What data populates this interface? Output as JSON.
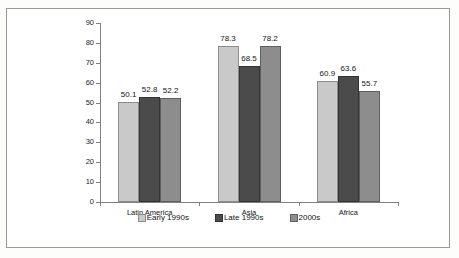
{
  "chart_data": {
    "type": "bar",
    "title": "",
    "xlabel": "",
    "ylabel": "Informal employment (in %)",
    "categories": [
      "Latin America",
      "Asia",
      "Africa"
    ],
    "series": [
      {
        "name": "Early 1990s",
        "color": "#c9c9c9",
        "values": [
          50.1,
          78.3,
          60.9
        ]
      },
      {
        "name": "Late 1990s",
        "color": "#4b4b4b",
        "values": [
          52.8,
          68.5,
          63.6
        ]
      },
      {
        "name": "2000s",
        "color": "#8d8d8d",
        "values": [
          52.2,
          78.2,
          55.7
        ]
      }
    ],
    "ylim": [
      0,
      90
    ],
    "ytick_step": 10,
    "yticks": [
      0,
      10,
      20,
      30,
      40,
      50,
      60,
      70,
      80,
      90
    ],
    "ytick_labels": [
      "0",
      "10",
      "20",
      "30",
      "40",
      "50",
      "60",
      "70",
      "80",
      "90"
    ],
    "data_labels": [
      [
        "50.1",
        "52.8",
        "52.2"
      ],
      [
        "78.3",
        "68.5",
        "78.2"
      ],
      [
        "60.9",
        "63.6",
        "55.7"
      ]
    ],
    "grid": false,
    "legend_position": "bottom"
  },
  "legend": {
    "items": [
      {
        "label": "Early 1990s",
        "swatch": "legend-swatch-early-1990s"
      },
      {
        "label": "Late 1990s",
        "swatch": "legend-swatch-late-1990s"
      },
      {
        "label": "2000s",
        "swatch": "legend-swatch-2000s"
      }
    ]
  }
}
